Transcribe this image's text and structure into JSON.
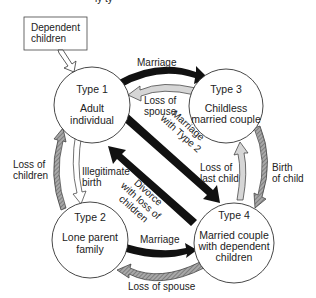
{
  "title_fragment": "ly ty",
  "input_box": {
    "line1": "Dependent",
    "line2": "children"
  },
  "nodes": [
    {
      "id": "type1",
      "title": "Type 1",
      "line1": "Adult",
      "line2": "individual"
    },
    {
      "id": "type2",
      "title": "Type 2",
      "line1": "Lone parent",
      "line2": "family"
    },
    {
      "id": "type3",
      "title": "Type 3",
      "line1": "Childless",
      "line2": "married couple"
    },
    {
      "id": "type4",
      "title": "Type 4",
      "line1": "Married couple",
      "line2": "with dependent",
      "line3": "children"
    }
  ],
  "edges": {
    "t1_t3_marriage": {
      "label": "Marriage",
      "from": "Type 1",
      "to": "Type 3",
      "style": "black"
    },
    "t3_t1_loss_spouse": {
      "line1": "Loss of",
      "line2": "spouse",
      "from": "Type 3",
      "to": "Type 1",
      "style": "light-grey"
    },
    "t1_t4_marriage_type2": {
      "line1": "Marriage",
      "line2": "with Type 2",
      "from": "Type 1",
      "to": "Type 4",
      "style": "black"
    },
    "t4_t1_divorce": {
      "line1": "Divorce",
      "line2": "with loss of",
      "line3": "children",
      "from": "Type 4",
      "to": "Type 1",
      "style": "black"
    },
    "t2_t1_loss_children": {
      "line1": "Loss of",
      "line2": "children",
      "from": "Type 2",
      "to": "Type 1",
      "style": "hatched-grey"
    },
    "t1_t2_illegitimate": {
      "line1": "Illegitimate",
      "line2": "birth",
      "from": "Type 1",
      "to": "Type 2",
      "style": "white"
    },
    "t4_t3_loss_last_child": {
      "line1": "Loss of",
      "line2": "last child",
      "from": "Type 4",
      "to": "Type 3",
      "style": "light-grey"
    },
    "t3_t4_birth": {
      "line1": "Birth",
      "line2": "of child",
      "from": "Type 3",
      "to": "Type 4",
      "style": "hatched-grey"
    },
    "t2_t4_marriage": {
      "label": "Marriage",
      "from": "Type 2",
      "to": "Type 4",
      "style": "black"
    },
    "t4_t2_loss_spouse": {
      "label": "Loss of spouse",
      "from": "Type 4",
      "to": "Type 2",
      "style": "hatched-grey"
    },
    "input_dependent_children": {
      "from": "Dependent children",
      "to": "Type 1",
      "style": "white"
    }
  },
  "colors": {
    "black_arrow": "#111111",
    "light_grey_arrow": "#d6d6d6",
    "hatched_grey_arrow": "#8a8a8a",
    "outline": "#333333"
  }
}
